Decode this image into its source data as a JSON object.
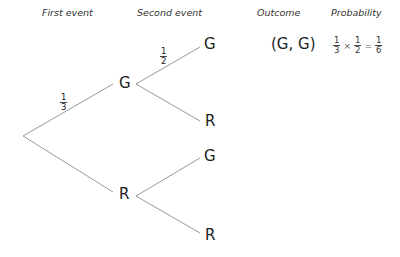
{
  "headers": {
    "first_event": "First event",
    "second_event": "Second event",
    "outcome": "Outcome",
    "probability": "Probability"
  },
  "tree": {
    "first_level": [
      {
        "label": "G",
        "branch_prob": {
          "num": "1",
          "den": "3"
        }
      },
      {
        "label": "R",
        "branch_prob": null
      }
    ],
    "second_level": [
      {
        "parent": "G",
        "label": "G",
        "branch_prob": {
          "num": "1",
          "den": "2"
        }
      },
      {
        "parent": "G",
        "label": "R",
        "branch_prob": null
      },
      {
        "parent": "R",
        "label": "G",
        "branch_prob": null
      },
      {
        "parent": "R",
        "label": "R",
        "branch_prob": null
      }
    ]
  },
  "outcomes": [
    {
      "outcome": "(G, G)",
      "probability": {
        "a": {
          "num": "1",
          "den": "3"
        },
        "times": "×",
        "b": {
          "num": "1",
          "den": "2"
        },
        "equals": "=",
        "result": {
          "num": "1",
          "den": "6"
        }
      }
    }
  ],
  "colors": {
    "line": "#9a9a9a",
    "text": "#222222"
  }
}
